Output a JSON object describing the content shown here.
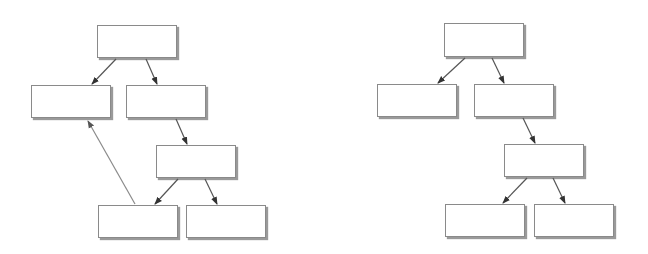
{
  "diagrams": [
    {
      "name": "tree-with-back-edge",
      "nodes": [
        {
          "id": "root",
          "x": 97,
          "y": 25,
          "w": 80,
          "h": 33
        },
        {
          "id": "left",
          "x": 31,
          "y": 85,
          "w": 80,
          "h": 33
        },
        {
          "id": "right",
          "x": 126,
          "y": 85,
          "w": 80,
          "h": 33
        },
        {
          "id": "center",
          "x": 156,
          "y": 145,
          "w": 80,
          "h": 33
        },
        {
          "id": "bottom-left",
          "x": 98,
          "y": 205,
          "w": 80,
          "h": 33
        },
        {
          "id": "bottom-right",
          "x": 186,
          "y": 205,
          "w": 80,
          "h": 33
        }
      ],
      "edges": [
        {
          "from": "root",
          "to": "left",
          "x1": 116,
          "y1": 59,
          "x2": 92,
          "y2": 84,
          "color": "#555555"
        },
        {
          "from": "root",
          "to": "right",
          "x1": 146,
          "y1": 59,
          "x2": 157,
          "y2": 84,
          "color": "#555555"
        },
        {
          "from": "right",
          "to": "center",
          "x1": 176,
          "y1": 119,
          "x2": 187,
          "y2": 144,
          "color": "#555555"
        },
        {
          "from": "center",
          "to": "bottom-left",
          "x1": 178,
          "y1": 179,
          "x2": 155,
          "y2": 204,
          "color": "#555555"
        },
        {
          "from": "center",
          "to": "bottom-right",
          "x1": 205,
          "y1": 179,
          "x2": 217,
          "y2": 204,
          "color": "#555555"
        },
        {
          "from": "bottom-left",
          "to": "left",
          "x1": 135,
          "y1": 204,
          "x2": 88,
          "y2": 121,
          "color": "#8a8a8a"
        }
      ]
    },
    {
      "name": "tree",
      "nodes": [
        {
          "id": "root",
          "x": 444,
          "y": 23,
          "w": 80,
          "h": 34
        },
        {
          "id": "left",
          "x": 377,
          "y": 84,
          "w": 80,
          "h": 33
        },
        {
          "id": "right",
          "x": 474,
          "y": 84,
          "w": 80,
          "h": 33
        },
        {
          "id": "center",
          "x": 504,
          "y": 144,
          "w": 80,
          "h": 33
        },
        {
          "id": "bottom-left",
          "x": 445,
          "y": 204,
          "w": 80,
          "h": 33
        },
        {
          "id": "bottom-right",
          "x": 534,
          "y": 204,
          "w": 80,
          "h": 33
        }
      ],
      "edges": [
        {
          "from": "root",
          "to": "left",
          "x1": 465,
          "y1": 58,
          "x2": 438,
          "y2": 83,
          "color": "#555555"
        },
        {
          "from": "root",
          "to": "right",
          "x1": 492,
          "y1": 58,
          "x2": 504,
          "y2": 83,
          "color": "#555555"
        },
        {
          "from": "right",
          "to": "center",
          "x1": 523,
          "y1": 118,
          "x2": 535,
          "y2": 143,
          "color": "#555555"
        },
        {
          "from": "center",
          "to": "bottom-left",
          "x1": 527,
          "y1": 178,
          "x2": 503,
          "y2": 203,
          "color": "#555555"
        },
        {
          "from": "center",
          "to": "bottom-right",
          "x1": 553,
          "y1": 178,
          "x2": 565,
          "y2": 203,
          "color": "#555555"
        }
      ]
    }
  ]
}
